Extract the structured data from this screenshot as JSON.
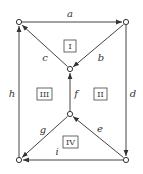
{
  "diagram": {
    "type": "directed-graph",
    "nodes": [
      {
        "id": "TL",
        "x": 19,
        "y": 22
      },
      {
        "id": "TR",
        "x": 126,
        "y": 22
      },
      {
        "id": "MU",
        "x": 70,
        "y": 69
      },
      {
        "id": "ML",
        "x": 70,
        "y": 114
      },
      {
        "id": "BL",
        "x": 19,
        "y": 160
      },
      {
        "id": "BR",
        "x": 126,
        "y": 160
      }
    ],
    "edges": [
      {
        "label": "a",
        "from": "TL",
        "to": "TR"
      },
      {
        "label": "b",
        "from": "TR",
        "to": "MU"
      },
      {
        "label": "c",
        "from": "MU",
        "to": "TL"
      },
      {
        "label": "d",
        "from": "TR",
        "to": "BR"
      },
      {
        "label": "e",
        "from": "BR",
        "to": "ML"
      },
      {
        "label": "f",
        "from": "ML",
        "to": "MU"
      },
      {
        "label": "g",
        "from": "ML",
        "to": "BL"
      },
      {
        "label": "h",
        "from": "BL",
        "to": "TL"
      },
      {
        "label": "i",
        "from": "BR",
        "to": "BL"
      }
    ],
    "regions": [
      "I",
      "II",
      "III",
      "IV"
    ]
  },
  "labels": {
    "a": "a",
    "b": "b",
    "c": "c",
    "d": "d",
    "e": "e",
    "f": "f",
    "g": "g",
    "h": "h",
    "i": "i",
    "r1": "I",
    "r2": "II",
    "r3": "III",
    "r4": "IV"
  }
}
